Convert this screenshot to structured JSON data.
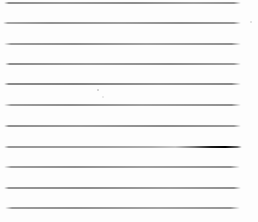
{
  "page": {
    "kind": "blank-ruled-notebook-page",
    "background": "#fdfdfd",
    "width": 258,
    "height": 222,
    "text_content": ""
  },
  "ruled_lines": [
    {
      "y": 2,
      "x1": 4,
      "x2": 241,
      "thickness": 2,
      "gradient": "linear-gradient(90deg, rgba(120,120,120,0) 0%, #8f8f8f 2%, #999999 25%, #8d8d8d 55%, #a0a0a0 80%, #949494 97%, rgba(120,120,120,0) 100%)"
    },
    {
      "y": 22,
      "x1": 3,
      "x2": 241,
      "thickness": 2,
      "gradient": "linear-gradient(90deg, rgba(120,120,120,0) 0%, #a6a6a6 2%, #939393 20%, #9e9e9e 50%, #8f8f8f 75%, #989898 97%, rgba(120,120,120,0) 100%)"
    },
    {
      "y": 43,
      "x1": 4,
      "x2": 241,
      "thickness": 2,
      "gradient": "linear-gradient(90deg, rgba(120,120,120,0) 0%, #9b9b9b 3%, #909090 30%, #a2a2a2 60%, #919191 96%, rgba(120,120,120,0) 100%)"
    },
    {
      "y": 63,
      "x1": 5,
      "x2": 241,
      "thickness": 2,
      "gradient": "linear-gradient(90deg, rgba(120,120,120,0) 0%, #8d8d8d 2%, #9a9a9a 35%, #8e8e8e 70%, #9c9c9c 97%, rgba(120,120,120,0) 100%)"
    },
    {
      "y": 83,
      "x1": 4,
      "x2": 241,
      "thickness": 2,
      "gradient": "linear-gradient(90deg, rgba(110,110,110,0) 0%, #8a8a8a 2%, #848484 30%, #949494 65%, #8a8a8a 96%, rgba(110,110,110,0) 100%)"
    },
    {
      "y": 104,
      "x1": 4,
      "x2": 241,
      "thickness": 2,
      "gradient": "linear-gradient(90deg, rgba(120,120,120,0) 0%, #9d9d9d 3%, #8f8f8f 28%, #a1a1a1 58%, #909090 96%, rgba(120,120,120,0) 100%)"
    },
    {
      "y": 125,
      "x1": 4,
      "x2": 241,
      "thickness": 2,
      "gradient": "linear-gradient(90deg, rgba(120,120,120,0) 0%, #909090 2%, #9b9b9b 32%, #8d8d8d 68%, #9a9a9a 97%, rgba(120,120,120,0) 100%)"
    },
    {
      "y": 146,
      "x1": 4,
      "x2": 242,
      "thickness": 2,
      "gradient": "linear-gradient(90deg, rgba(120,120,120,0) 0%, #979797 2%, #a0a0a0 40%, #aeaeae 62%, #c6c6c6 72%, #777777 80%, #1c1c1c 87%, #000000 93%, rgba(30,30,30,0.65) 98%, rgba(30,30,30,0) 100%)"
    },
    {
      "y": 166,
      "x1": 4,
      "x2": 240,
      "thickness": 2,
      "gradient": "linear-gradient(90deg, rgba(120,120,120,0) 0%, #9c9c9c 3%, #919191 30%, #a0a0a0 60%, #939393 96%, rgba(120,120,120,0) 100%)"
    },
    {
      "y": 187,
      "x1": 4,
      "x2": 241,
      "thickness": 2,
      "gradient": "linear-gradient(90deg, rgba(120,120,120,0) 0%, #959595 2%, #8e8e8e 35%, #9e9e9e 70%, #909090 97%, rgba(120,120,120,0) 100%)"
    },
    {
      "y": 207,
      "x1": 5,
      "x2": 240,
      "thickness": 2,
      "gradient": "linear-gradient(90deg, rgba(120,120,120,0) 0%, #9a9a9a 3%, #929292 30%, #a3a3a3 65%, #969696 96%, rgba(120,120,120,0) 100%)"
    }
  ],
  "specks": [
    {
      "x": 97,
      "y": 89,
      "size": 2,
      "color": "#c9c9c9"
    },
    {
      "x": 250,
      "y": 21,
      "size": 2,
      "color": "#d8d8d8"
    },
    {
      "x": 102,
      "y": 96,
      "size": 2,
      "color": "#e2e2e2"
    }
  ],
  "colors": {
    "rule_line_gray": "#949494",
    "ink_streak_dark": "#000000",
    "paper_white": "#fdfdfd"
  }
}
